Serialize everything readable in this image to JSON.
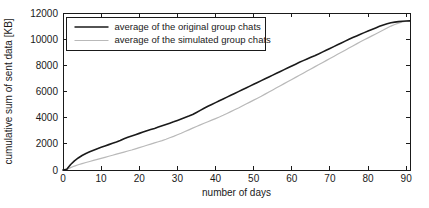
{
  "chart_data": {
    "type": "line",
    "title": "",
    "xlabel": "number of days",
    "ylabel": "cumulative sum of sent data [KB]",
    "xlim": [
      0,
      91
    ],
    "ylim": [
      0,
      12000
    ],
    "xticks": [
      0,
      10,
      20,
      30,
      40,
      50,
      60,
      70,
      80,
      90
    ],
    "yticks": [
      0,
      2000,
      4000,
      6000,
      8000,
      10000,
      12000
    ],
    "xtick_labels": [
      "0",
      "10",
      "20",
      "30",
      "40",
      "50",
      "60",
      "70",
      "80",
      "90"
    ],
    "ytick_labels": [
      "0",
      "2000",
      "4000",
      "6000",
      "8000",
      "10000",
      "12000"
    ],
    "grid": false,
    "legend_position": "upper-left-inside",
    "colors": {
      "original": "#1a1a1a",
      "simulated": "#b9b9b9",
      "axis": "#1a1a1a",
      "background": "#ffffff"
    },
    "x": [
      0,
      1,
      2,
      3,
      4,
      5,
      6,
      7,
      8,
      9,
      10,
      11,
      12,
      13,
      14,
      15,
      16,
      17,
      18,
      19,
      20,
      21,
      22,
      23,
      24,
      25,
      26,
      27,
      28,
      29,
      30,
      31,
      32,
      33,
      34,
      35,
      36,
      37,
      38,
      39,
      40,
      41,
      42,
      43,
      44,
      45,
      46,
      47,
      48,
      49,
      50,
      51,
      52,
      53,
      54,
      55,
      56,
      57,
      58,
      59,
      60,
      61,
      62,
      63,
      64,
      65,
      66,
      67,
      68,
      69,
      70,
      71,
      72,
      73,
      74,
      75,
      76,
      77,
      78,
      79,
      80,
      81,
      82,
      83,
      84,
      85,
      86,
      87,
      88,
      89,
      90,
      91
    ],
    "series": [
      {
        "name": "average of the original group chats",
        "color": "#1a1a1a",
        "values": [
          0,
          60,
          420,
          700,
          920,
          1110,
          1260,
          1390,
          1510,
          1630,
          1740,
          1840,
          1940,
          2040,
          2140,
          2250,
          2390,
          2500,
          2600,
          2700,
          2800,
          2900,
          3000,
          3090,
          3180,
          3280,
          3380,
          3480,
          3580,
          3680,
          3790,
          3900,
          4010,
          4120,
          4240,
          4400,
          4560,
          4720,
          4870,
          5010,
          5150,
          5290,
          5430,
          5570,
          5710,
          5850,
          5990,
          6130,
          6270,
          6410,
          6550,
          6690,
          6830,
          6970,
          7110,
          7250,
          7390,
          7530,
          7670,
          7810,
          7950,
          8090,
          8230,
          8360,
          8490,
          8620,
          8740,
          8870,
          9010,
          9150,
          9290,
          9430,
          9570,
          9710,
          9850,
          9990,
          10120,
          10250,
          10380,
          10500,
          10620,
          10740,
          10860,
          10980,
          11090,
          11180,
          11250,
          11300,
          11340,
          11370,
          11390,
          11400
        ]
      },
      {
        "name": "average of the simulated group chats",
        "color": "#b9b9b9",
        "values": [
          0,
          40,
          180,
          300,
          400,
          490,
          570,
          650,
          730,
          810,
          890,
          970,
          1050,
          1130,
          1210,
          1290,
          1370,
          1450,
          1530,
          1620,
          1710,
          1800,
          1890,
          1980,
          2070,
          2160,
          2250,
          2350,
          2460,
          2570,
          2690,
          2810,
          2940,
          3070,
          3200,
          3330,
          3450,
          3570,
          3690,
          3810,
          3930,
          4050,
          4180,
          4320,
          4460,
          4600,
          4740,
          4890,
          5040,
          5190,
          5340,
          5490,
          5640,
          5800,
          5960,
          6120,
          6280,
          6440,
          6600,
          6760,
          6920,
          7080,
          7240,
          7400,
          7560,
          7720,
          7880,
          8040,
          8200,
          8360,
          8520,
          8680,
          8840,
          9000,
          9160,
          9320,
          9480,
          9640,
          9800,
          9950,
          10100,
          10250,
          10400,
          10550,
          10700,
          10850,
          11000,
          11120,
          11230,
          11310,
          11370,
          11400
        ]
      }
    ]
  },
  "legend": {
    "entries": [
      {
        "label": "average of the original group chats",
        "swatch": "line-solid-dark"
      },
      {
        "label": "average of the simulated group chats",
        "swatch": "line-solid-light"
      }
    ]
  }
}
